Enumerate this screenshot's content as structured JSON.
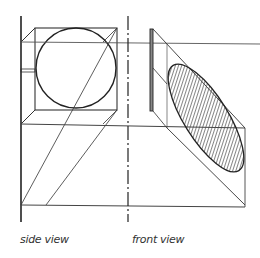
{
  "diagram": {
    "labels": {
      "side_view": "side view",
      "front_view": "front view"
    },
    "colors": {
      "ink": "#222222",
      "thin": "#555555",
      "hatch": "#444444",
      "background": "#ffffff"
    }
  }
}
